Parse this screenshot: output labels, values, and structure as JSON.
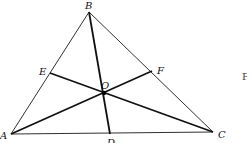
{
  "figure": {
    "type": "triangle-with-cevians",
    "points": {
      "A": {
        "x": 11,
        "y": 134
      },
      "B": {
        "x": 89,
        "y": 12
      },
      "C": {
        "x": 213,
        "y": 132
      },
      "D": {
        "x": 110,
        "y": 134
      },
      "E": {
        "x": 50,
        "y": 73
      },
      "F": {
        "x": 152,
        "y": 71
      },
      "O": {
        "x": 104,
        "y": 93
      }
    },
    "labels": {
      "A": "A",
      "B": "B",
      "C": "C",
      "D": "D",
      "E": "E",
      "F": "F",
      "O": "O"
    },
    "sides": [
      "AB",
      "BC",
      "CA"
    ],
    "cevians": [
      "BD",
      "CE",
      "AF"
    ],
    "intersection": "O",
    "edge_fragment": "F",
    "colors": {
      "line": "#111111",
      "background": "#ffffff"
    }
  }
}
